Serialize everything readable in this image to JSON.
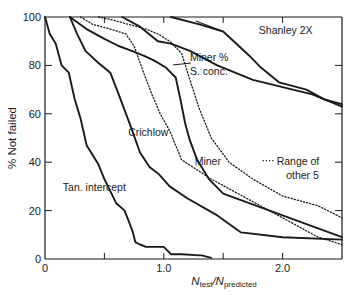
{
  "chart_data": {
    "type": "line",
    "title": "",
    "xlabel": "N_test/N_predicted",
    "xlabel_main": "N",
    "xlabel_sub1": "test",
    "xlabel_slash": "/N",
    "xlabel_sub2": "predicted",
    "ylabel": "% Not failed",
    "xlim": [
      0,
      2.5
    ],
    "ylim": [
      0,
      100
    ],
    "x_ticks": [
      0,
      0.5,
      1.0,
      1.5,
      2.0
    ],
    "x_tick_labels": [
      "0",
      "",
      "1.0",
      "",
      "2.0"
    ],
    "y_ticks": [
      0,
      20,
      40,
      60,
      80,
      100
    ],
    "y_tick_labels": [
      "0",
      "20",
      "40",
      "60",
      "80",
      "100"
    ],
    "grid": false,
    "legend": "inline annotations",
    "series": [
      {
        "name": "Tan. intercept",
        "style": "solid",
        "x": [
          0.0,
          0.04,
          0.09,
          0.14,
          0.2,
          0.25,
          0.3,
          0.35,
          0.45,
          0.5,
          0.55,
          0.6,
          0.67,
          0.71,
          0.74,
          0.76,
          0.8,
          0.85,
          0.9,
          0.98,
          1.0,
          1.06,
          1.15,
          1.3,
          1.32,
          1.4,
          0.0
        ],
        "y": [
          100,
          93,
          89,
          80,
          77,
          66,
          58,
          47,
          39,
          33,
          28,
          23,
          20,
          15,
          11,
          7,
          6,
          5,
          5,
          5,
          5,
          2,
          2,
          1.5,
          1.5,
          0.5,
          100
        ]
      },
      {
        "name": "Crichlow",
        "style": "solid",
        "x": [
          0.21,
          0.27,
          0.34,
          0.45,
          0.55,
          0.62,
          0.72,
          0.8,
          0.88,
          0.96,
          1.05,
          1.2,
          1.45,
          1.65,
          2.0,
          2.5
        ],
        "y": [
          100,
          93,
          86,
          81,
          77,
          68,
          55,
          44,
          38,
          35,
          30,
          25,
          18,
          11,
          9,
          8
        ]
      },
      {
        "name": "Miner",
        "style": "solid",
        "x": [
          0.21,
          0.35,
          0.5,
          0.62,
          0.73,
          0.83,
          0.92,
          1.02,
          1.1,
          1.14,
          1.18,
          1.22,
          1.28,
          1.38,
          1.5,
          2.0,
          2.5
        ],
        "y": [
          100,
          95,
          91,
          88,
          86,
          84,
          82,
          79,
          75,
          66,
          56,
          49,
          41,
          33,
          27,
          18,
          9
        ]
      },
      {
        "name": "Miner % S. conc.",
        "style": "solid",
        "x": [
          0.65,
          0.8,
          0.95,
          1.06,
          1.22,
          1.45,
          1.75,
          2.0,
          2.25,
          2.5
        ],
        "y": [
          100,
          96,
          90,
          89,
          86,
          80,
          74,
          71,
          68,
          63
        ]
      },
      {
        "name": "Shanley 2X",
        "style": "solid",
        "x": [
          1.06,
          1.3,
          1.5,
          1.72,
          1.82,
          1.97,
          2.05,
          2.2,
          2.35,
          2.5
        ],
        "y": [
          100,
          97,
          94,
          84,
          79,
          73,
          72,
          70,
          66,
          64
        ]
      },
      {
        "name": "Range of other 5 (upper)",
        "style": "dotted",
        "x": [
          0.45,
          0.55,
          0.7,
          0.85,
          0.95,
          1.05,
          1.15,
          1.22,
          1.3,
          1.4,
          1.55,
          1.75,
          2.0,
          2.3,
          2.5
        ],
        "y": [
          100,
          99,
          97,
          95,
          93,
          90,
          85,
          74,
          62,
          50,
          40,
          33,
          26,
          22,
          17
        ]
      },
      {
        "name": "Range of other 5 (lower)",
        "style": "dotted",
        "x": [
          0.3,
          0.4,
          0.55,
          0.68,
          0.75,
          0.83,
          0.9,
          0.97,
          1.05,
          1.15,
          1.4,
          1.7,
          2.0,
          2.3,
          2.5
        ],
        "y": [
          100,
          97,
          95,
          93,
          88,
          77,
          68,
          60,
          53,
          41,
          33,
          25,
          17,
          9,
          6
        ]
      }
    ],
    "annotations": [
      {
        "text": "Shanley 2X",
        "x": 1.8,
        "y": 93
      },
      {
        "text": "Miner %",
        "x": 1.22,
        "y": 82
      },
      {
        "text": "S. conc.",
        "x": 1.22,
        "y": 76
      },
      {
        "text": "Crichlow",
        "x": 0.7,
        "y": 51
      },
      {
        "text": "Miner",
        "x": 1.26,
        "y": 39
      },
      {
        "text": "Range of",
        "x": 1.95,
        "y": 39
      },
      {
        "text": "other 5",
        "x": 2.03,
        "y": 33
      },
      {
        "text": "Tan. intercept",
        "x": 0.15,
        "y": 28
      }
    ]
  }
}
